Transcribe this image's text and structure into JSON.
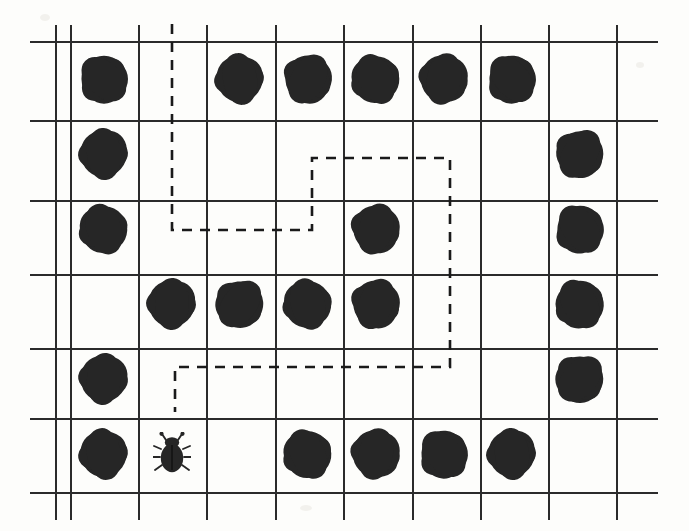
{
  "scene": {
    "title": "Bug Maze Grid Puzzle",
    "width": 689,
    "height": 531,
    "background_color": "#fdfdfb",
    "grid_line_color": "#2b2b2b",
    "item_color": "#262626",
    "path_color": "#1a1a1a"
  },
  "grid": {
    "rows": 6,
    "cols": 9,
    "cell_width": 68,
    "cell_height": 75,
    "origin_x": 70,
    "origin_y": 41,
    "vertical_line_x": [
      55,
      70,
      138,
      206,
      275,
      343,
      412,
      480,
      548,
      616
    ],
    "vertical_line_top": 25,
    "vertical_line_bottom": 520,
    "horizontal_line_y": [
      41,
      120,
      200,
      274,
      348,
      418,
      492
    ],
    "horizontal_line_left": 30,
    "horizontal_line_right": 658
  },
  "items": {
    "blob_label": "food-blob",
    "bug_label": "bug-marker",
    "cells": [
      {
        "row": 1,
        "col": 1,
        "kind": "blob"
      },
      {
        "row": 1,
        "col": 3,
        "kind": "blob"
      },
      {
        "row": 1,
        "col": 4,
        "kind": "blob"
      },
      {
        "row": 1,
        "col": 5,
        "kind": "blob"
      },
      {
        "row": 1,
        "col": 6,
        "kind": "blob"
      },
      {
        "row": 1,
        "col": 7,
        "kind": "blob"
      },
      {
        "row": 2,
        "col": 1,
        "kind": "blob"
      },
      {
        "row": 2,
        "col": 8,
        "kind": "blob"
      },
      {
        "row": 3,
        "col": 1,
        "kind": "blob"
      },
      {
        "row": 3,
        "col": 5,
        "kind": "blob"
      },
      {
        "row": 3,
        "col": 8,
        "kind": "blob"
      },
      {
        "row": 4,
        "col": 2,
        "kind": "blob"
      },
      {
        "row": 4,
        "col": 3,
        "kind": "blob"
      },
      {
        "row": 4,
        "col": 4,
        "kind": "blob"
      },
      {
        "row": 4,
        "col": 5,
        "kind": "blob"
      },
      {
        "row": 4,
        "col": 8,
        "kind": "blob"
      },
      {
        "row": 5,
        "col": 1,
        "kind": "blob"
      },
      {
        "row": 5,
        "col": 8,
        "kind": "blob"
      },
      {
        "row": 6,
        "col": 1,
        "kind": "blob"
      },
      {
        "row": 6,
        "col": 2,
        "kind": "bug"
      },
      {
        "row": 6,
        "col": 4,
        "kind": "blob"
      },
      {
        "row": 6,
        "col": 5,
        "kind": "blob"
      },
      {
        "row": 6,
        "col": 6,
        "kind": "blob"
      },
      {
        "row": 6,
        "col": 7,
        "kind": "blob"
      }
    ]
  },
  "path": {
    "label": "dashed-route",
    "dash_pattern": "10 8",
    "stroke_width": 2.6,
    "points": [
      [
        172,
        24
      ],
      [
        172,
        230
      ],
      [
        312,
        230
      ],
      [
        312,
        158
      ],
      [
        450,
        158
      ],
      [
        450,
        367
      ],
      [
        175,
        367
      ],
      [
        175,
        412
      ]
    ]
  },
  "counts": {
    "blob_total": 23,
    "bug_total": 1
  }
}
